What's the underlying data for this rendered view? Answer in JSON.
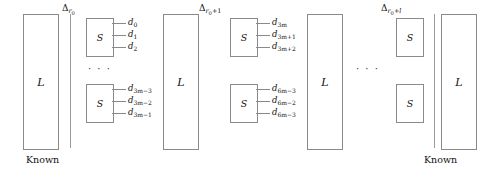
{
  "figure": {
    "known_left_label": "Known",
    "known_right_label": "Known",
    "ellipsis": "· · ·",
    "column_label": "L",
    "box_label": "S"
  },
  "columns": [
    {
      "name": "left-known-column",
      "label": "L"
    },
    {
      "name": "middle-column-1",
      "label": "L"
    },
    {
      "name": "middle-column-2",
      "label": "L"
    },
    {
      "name": "right-known-column",
      "label": "L"
    }
  ],
  "groups": [
    {
      "name": "group-r0",
      "delta": {
        "base": "Δ",
        "sub": "r",
        "subsub": "0",
        "suffix": ""
      },
      "boxes": [
        {
          "name": "s-box-top",
          "label": "S",
          "outputs": [
            {
              "base": "d",
              "sub": "0"
            },
            {
              "base": "d",
              "sub": "1"
            },
            {
              "base": "d",
              "sub": "2"
            }
          ]
        },
        {
          "name": "s-box-bottom",
          "label": "S",
          "outputs": [
            {
              "base": "d",
              "sub": "3m−3"
            },
            {
              "base": "d",
              "sub": "3m−2"
            },
            {
              "base": "d",
              "sub": "3m−1"
            }
          ]
        }
      ],
      "ellipsis": "· · ·"
    },
    {
      "name": "group-r0-plus-1",
      "delta": {
        "base": "Δ",
        "sub": "r",
        "subsub": "0",
        "suffix": "+1"
      },
      "boxes": [
        {
          "name": "s-box-top",
          "label": "S",
          "outputs": [
            {
              "base": "d",
              "sub": "3m"
            },
            {
              "base": "d",
              "sub": "3m+1"
            },
            {
              "base": "d",
              "sub": "3m+2"
            }
          ]
        },
        {
          "name": "s-box-bottom",
          "label": "S",
          "outputs": [
            {
              "base": "d",
              "sub": "6m−3"
            },
            {
              "base": "d",
              "sub": "6m−2"
            },
            {
              "base": "d",
              "sub": "6m−3"
            }
          ]
        }
      ],
      "ellipsis": "· · ·"
    },
    {
      "name": "group-r0-plus-l",
      "delta": {
        "base": "Δ",
        "sub": "r",
        "subsub": "0",
        "suffix": "+l"
      },
      "boxes": [
        {
          "name": "s-box-top",
          "label": "S",
          "outputs": []
        },
        {
          "name": "s-box-bottom",
          "label": "S",
          "outputs": []
        }
      ],
      "ellipsis": "· · ·"
    }
  ],
  "inter_group_ellipsis": "· · ·"
}
